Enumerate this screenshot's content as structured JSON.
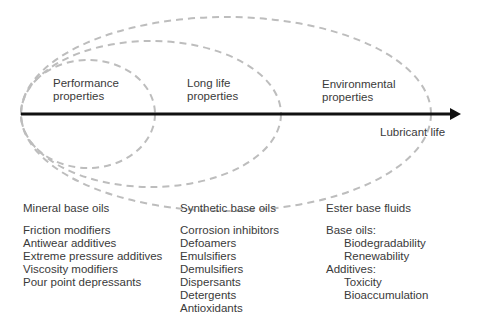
{
  "diagram": {
    "axis": {
      "label": "Lubricant life"
    },
    "regions": [
      {
        "label_line1": "Performance",
        "label_line2": "properties"
      },
      {
        "label_line1": "Long life",
        "label_line2": "properties"
      },
      {
        "label_line1": "Environmental",
        "label_line2": "properties"
      }
    ],
    "columns": [
      {
        "heading": "Mineral base oils",
        "items": [
          "Friction modifiers",
          "Antiwear additives",
          "Extreme pressure additives",
          "Viscosity modifiers",
          "Pour point depressants"
        ]
      },
      {
        "heading": "Synthetic base oils",
        "items": [
          "Corrosion inhibitors",
          "Defoamers",
          "Emulsifiers",
          "Demulsifiers",
          "Dispersants",
          "Detergents",
          "Antioxidants"
        ]
      },
      {
        "heading": "Ester base fluids",
        "items": [
          {
            "text": "Base oils:",
            "indent": false
          },
          {
            "text": "Biodegradability",
            "indent": true
          },
          {
            "text": "Renewability",
            "indent": true
          },
          {
            "text": "Additives:",
            "indent": false
          },
          {
            "text": "Toxicity",
            "indent": true
          },
          {
            "text": "Bioaccumulation",
            "indent": true
          }
        ]
      }
    ],
    "colors": {
      "axis": "#111111",
      "ellipse_dash": "#bdbdbd",
      "text": "#3a3a3a"
    }
  }
}
